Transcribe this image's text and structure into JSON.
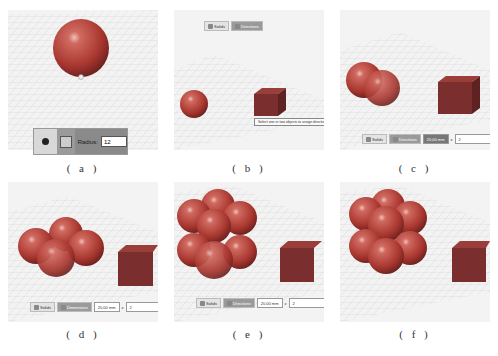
{
  "figure": {
    "panels": [
      {
        "id": "a",
        "caption": "( a )",
        "description": "single red sphere on grid",
        "radius_bar": {
          "sphere_icon": "sphere-icon",
          "cube_icon": "solid-icon",
          "label": "Radius:",
          "value": "12"
        }
      },
      {
        "id": "b",
        "caption": "( b )",
        "description": "sphere and cube on grid",
        "toolbar": {
          "solids_label": "Solids",
          "directions_label": "Directions"
        },
        "tooltip": "Select one or two objects to assign directions"
      },
      {
        "id": "c",
        "caption": "( c )",
        "description": "two spheres overlapping, cube",
        "toolbar": {
          "solids_label": "Solids",
          "directions_label": "Directions",
          "distance_value": "20.00 mm",
          "times": "x",
          "count": "2"
        }
      },
      {
        "id": "d",
        "caption": "( d )",
        "description": "four spheres, cube",
        "toolbar": {
          "solids_label": "Solids",
          "directions_label": "Dimensions",
          "distance_value": "20.00 mm",
          "times": "x",
          "count": "2"
        }
      },
      {
        "id": "e",
        "caption": "( e )",
        "description": "eight spheres in array, cube",
        "toolbar": {
          "solids_label": "Solids",
          "directions_label": "Directions",
          "distance_value": "20.00 mm",
          "times": "x",
          "count": "2"
        }
      },
      {
        "id": "f",
        "caption": "( f )",
        "description": "final 2x2x2 sphere array, cube"
      }
    ]
  },
  "colors": {
    "sphere": "#b0403a",
    "cube": "#7a2e2e",
    "grid": "#c8c8c8",
    "bg": "#f3f3f3"
  }
}
